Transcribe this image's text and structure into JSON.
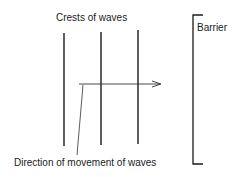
{
  "diagram": {
    "title_label": "Crests of waves",
    "barrier_label": "Barrier",
    "direction_label": "Direction of movement of waves",
    "crest_count": 3
  }
}
